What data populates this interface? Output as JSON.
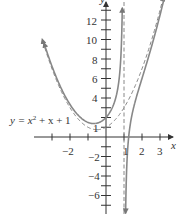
{
  "chart_data": {
    "type": "line",
    "title": "",
    "xlabel": "x",
    "ylabel": "y",
    "xlim": [
      -3.9,
      4.0
    ],
    "ylim": [
      -7.5,
      14
    ],
    "x_ticks": [
      -3,
      -2,
      -1,
      1,
      2,
      3
    ],
    "x_tick_labels": [
      "-2",
      "1",
      "2",
      "3"
    ],
    "y_ticks": [
      -7,
      -6,
      -5,
      -4,
      -3,
      -2,
      -1,
      1,
      2,
      3,
      4,
      5,
      6,
      7,
      8,
      9,
      10,
      11,
      12,
      13
    ],
    "y_tick_labels": [
      "12",
      "10",
      "8",
      "6",
      "4",
      "1",
      "-2",
      "-4",
      "-6"
    ],
    "grid": false,
    "series": [
      {
        "name": "f(x) = x^2 + x + 1 - 1/(x - 1)",
        "style": "solid",
        "color": "#808080",
        "points_left_branch": [
          [
            -3.4,
            9.5
          ],
          [
            -3,
            7.25
          ],
          [
            -2,
            3.33
          ],
          [
            -1,
            1.5
          ],
          [
            -0.5,
            1.42
          ],
          [
            0,
            2
          ],
          [
            0.5,
            3.75
          ],
          [
            0.8,
            7.44
          ],
          [
            0.9,
            12.71
          ]
        ],
        "points_right_branch": [
          [
            1.08,
            -10.3
          ],
          [
            1.1,
            -6.69
          ],
          [
            1.2,
            -1.36
          ],
          [
            1.5,
            2.75
          ],
          [
            2,
            6
          ],
          [
            2.5,
            8.08
          ],
          [
            3,
            12.5
          ],
          [
            3.3,
            13.9
          ]
        ]
      },
      {
        "name": "y = x^2 + x + 1",
        "style": "dashed",
        "color": "#808080",
        "points": [
          [
            -3.5,
            9.75
          ],
          [
            -3,
            7
          ],
          [
            -2,
            3
          ],
          [
            -1,
            1
          ],
          [
            -0.5,
            0.75
          ],
          [
            0,
            1
          ],
          [
            1,
            3
          ],
          [
            2,
            7
          ],
          [
            3,
            13
          ],
          [
            3.2,
            14.44
          ]
        ]
      },
      {
        "name": "vertical asymptote x = 1",
        "style": "dashed",
        "color": "#808080",
        "x": 1
      }
    ],
    "annotations": [
      {
        "text": "y = x² + x + 1",
        "x": -2.4,
        "y": 1.3
      }
    ]
  },
  "labels": {
    "x_axis": "x",
    "y_axis": "y",
    "x_ticks": {
      "m2": "−2",
      "p1": "1",
      "p2": "2",
      "p3": "3"
    },
    "y_ticks": {
      "p12": "12",
      "p10": "10",
      "p8": "8",
      "p6": "6",
      "p4": "4",
      "p1": "1",
      "m2": "−2",
      "m4": "−4",
      "m6": "−6"
    },
    "curve_label_prefix": "y = x",
    "curve_label_exp": "2",
    "curve_label_suffix": " + x + 1"
  }
}
